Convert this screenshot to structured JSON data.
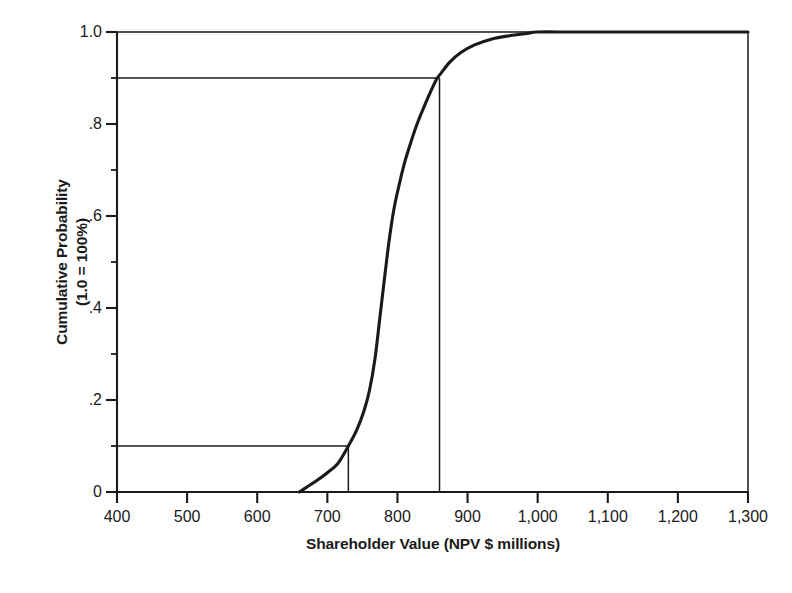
{
  "chart_data": {
    "type": "line",
    "title": "",
    "subtitle": "",
    "xlabel": "Shareholder Value (NPV $ millions)",
    "ylabel": "Cumulative Probability",
    "ylabel_line2": "(1.0 = 100%)",
    "xlim": [
      400,
      1300
    ],
    "ylim": [
      0,
      1.0
    ],
    "grid": false,
    "legend": "none",
    "x_ticks": [
      400,
      500,
      600,
      700,
      800,
      900,
      1000,
      1100,
      1200,
      1300
    ],
    "x_tick_labels": [
      "400",
      "500",
      "600",
      "700",
      "800",
      "900",
      "1,000",
      "1,100",
      "1,200",
      "1,300"
    ],
    "y_ticks": [
      0,
      0.2,
      0.4,
      0.6,
      0.8,
      1.0
    ],
    "y_tick_labels": [
      "0",
      ".2",
      ".4",
      ".6",
      ".8",
      "1.0"
    ],
    "y_minor_ticks": [
      0.1,
      0.3,
      0.5,
      0.7,
      0.9
    ],
    "series": [
      {
        "name": "Cumulative probability distribution of shareholder value",
        "x": [
          660,
          672,
          685,
          700,
          715,
          730,
          742,
          752,
          760,
          768,
          775,
          782,
          788,
          795,
          802,
          810,
          818,
          828,
          840,
          855,
          862,
          875,
          890,
          910,
          935,
          960,
          985,
          1000,
          1050,
          1120,
          1200,
          1300
        ],
        "y": [
          0.0,
          0.012,
          0.025,
          0.042,
          0.062,
          0.1,
          0.135,
          0.175,
          0.22,
          0.29,
          0.38,
          0.47,
          0.545,
          0.615,
          0.665,
          0.715,
          0.755,
          0.8,
          0.845,
          0.895,
          0.91,
          0.935,
          0.955,
          0.972,
          0.985,
          0.992,
          0.997,
          1.0,
          1.0,
          1.0,
          1.0,
          1.0
        ]
      }
    ],
    "reference_lines": [
      {
        "name": "p10-reference",
        "probability": 0.1,
        "value": 730,
        "horizontal_from_x": 400,
        "vertical_from_y": 0
      },
      {
        "name": "p90-reference",
        "probability": 0.9,
        "value": 860,
        "horizontal_from_x": 400,
        "vertical_from_y": 0
      }
    ],
    "colors": {
      "curve": "#1a1a1a",
      "axis": "#1a1a1a",
      "reference_line": "#1a1a1a",
      "background": "#ffffff"
    }
  },
  "axis_titles": {
    "x": "Shareholder Value (NPV $ millions)",
    "y_line1": "Cumulative Probability",
    "y_line2": "(1.0 = 100%)"
  },
  "bottom_caption": ""
}
